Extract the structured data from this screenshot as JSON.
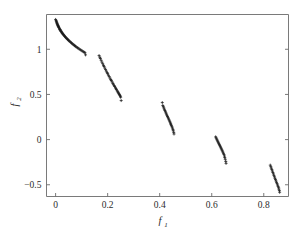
{
  "figure": {
    "background_color": "#ffffff",
    "axis_color": "#6b6b6b",
    "marker_color": "#1a1a1a",
    "marker_symbol": "plus-marker"
  },
  "axes": {
    "x_title": "f",
    "x_subscript": "1",
    "y_title": "f",
    "y_subscript": "2",
    "x_ticks": [
      "0",
      "0.2",
      "0.4",
      "0.6",
      "0.8"
    ],
    "x_tick_values": [
      0,
      0.2,
      0.4,
      0.6,
      0.8
    ],
    "y_ticks": [
      "1",
      "0.5",
      "0",
      "−0.5"
    ],
    "y_tick_values": [
      1,
      0.5,
      0,
      -0.5
    ]
  },
  "chart_data": {
    "type": "scatter",
    "title": "",
    "subtitle": "",
    "xlabel": "f1",
    "ylabel": "f2",
    "xlim": [
      -0.035,
      0.895
    ],
    "ylim": [
      -0.63,
      1.385
    ],
    "grid": false,
    "legend": null,
    "marker": "plus",
    "marker_size": 3.0,
    "marker_color": "#1a1a1a",
    "series": [
      {
        "name": "pareto-front-segment-1",
        "x": [
          0.0,
          0.002,
          0.003,
          0.004,
          0.005,
          0.006,
          0.007,
          0.008,
          0.009,
          0.01,
          0.011,
          0.012,
          0.013,
          0.015,
          0.016,
          0.017,
          0.018,
          0.02,
          0.021,
          0.023,
          0.025,
          0.026,
          0.028,
          0.03,
          0.032,
          0.034,
          0.036,
          0.038,
          0.04,
          0.043,
          0.045,
          0.047,
          0.05,
          0.052,
          0.055,
          0.058,
          0.061,
          0.064,
          0.067,
          0.07,
          0.073,
          0.076,
          0.079,
          0.083,
          0.086,
          0.09,
          0.094,
          0.098,
          0.102,
          0.106,
          0.11,
          0.113,
          0.115
        ],
        "y": [
          1.33,
          1.318,
          1.308,
          1.299,
          1.291,
          1.283,
          1.276,
          1.269,
          1.262,
          1.256,
          1.25,
          1.244,
          1.238,
          1.227,
          1.222,
          1.217,
          1.212,
          1.203,
          1.198,
          1.19,
          1.181,
          1.177,
          1.169,
          1.162,
          1.155,
          1.148,
          1.141,
          1.134,
          1.128,
          1.119,
          1.113,
          1.107,
          1.099,
          1.093,
          1.085,
          1.077,
          1.07,
          1.062,
          1.055,
          1.048,
          1.041,
          1.034,
          1.027,
          1.019,
          1.013,
          1.005,
          0.997,
          0.989,
          0.982,
          0.974,
          0.967,
          0.961,
          0.938
        ]
      },
      {
        "name": "pareto-front-segment-2",
        "x": [
          0.167,
          0.17,
          0.172,
          0.175,
          0.178,
          0.181,
          0.184,
          0.186,
          0.189,
          0.192,
          0.195,
          0.198,
          0.2,
          0.203,
          0.206,
          0.209,
          0.212,
          0.214,
          0.217,
          0.22,
          0.222,
          0.225,
          0.227,
          0.23,
          0.232,
          0.234,
          0.237,
          0.239,
          0.241,
          0.243,
          0.245,
          0.247,
          0.249,
          0.25,
          0.252
        ],
        "y": [
          0.93,
          0.912,
          0.898,
          0.878,
          0.858,
          0.84,
          0.822,
          0.81,
          0.792,
          0.775,
          0.758,
          0.741,
          0.73,
          0.713,
          0.697,
          0.681,
          0.665,
          0.654,
          0.639,
          0.623,
          0.613,
          0.598,
          0.588,
          0.573,
          0.563,
          0.553,
          0.539,
          0.529,
          0.519,
          0.509,
          0.499,
          0.489,
          0.479,
          0.469,
          0.432
        ]
      },
      {
        "name": "pareto-front-segment-3",
        "x": [
          0.41,
          0.412,
          0.414,
          0.416,
          0.418,
          0.42,
          0.422,
          0.424,
          0.426,
          0.428,
          0.43,
          0.432,
          0.434,
          0.436,
          0.438,
          0.44,
          0.442,
          0.443,
          0.445,
          0.447,
          0.449,
          0.451,
          0.452,
          0.454,
          0.455
        ],
        "y": [
          0.41,
          0.378,
          0.364,
          0.35,
          0.336,
          0.322,
          0.308,
          0.295,
          0.282,
          0.269,
          0.256,
          0.243,
          0.23,
          0.218,
          0.205,
          0.193,
          0.18,
          0.168,
          0.155,
          0.142,
          0.128,
          0.113,
          0.098,
          0.08,
          0.062
        ]
      },
      {
        "name": "pareto-front-segment-4",
        "x": [
          0.615,
          0.617,
          0.619,
          0.621,
          0.623,
          0.625,
          0.627,
          0.629,
          0.631,
          0.633,
          0.635,
          0.637,
          0.639,
          0.641,
          0.643,
          0.645,
          0.647,
          0.649,
          0.65,
          0.652,
          0.654,
          0.655
        ],
        "y": [
          0.03,
          0.018,
          0.006,
          -0.006,
          -0.018,
          -0.03,
          -0.042,
          -0.054,
          -0.066,
          -0.078,
          -0.09,
          -0.102,
          -0.114,
          -0.126,
          -0.139,
          -0.152,
          -0.166,
          -0.182,
          -0.199,
          -0.218,
          -0.242,
          -0.263
        ]
      },
      {
        "name": "pareto-front-segment-5",
        "x": [
          0.825,
          0.827,
          0.829,
          0.831,
          0.833,
          0.835,
          0.837,
          0.839,
          0.841,
          0.843,
          0.845,
          0.847,
          0.849,
          0.851,
          0.853,
          0.855,
          0.857,
          0.858,
          0.86,
          0.861
        ],
        "y": [
          -0.283,
          -0.3,
          -0.316,
          -0.332,
          -0.348,
          -0.364,
          -0.38,
          -0.396,
          -0.412,
          -0.428,
          -0.443,
          -0.458,
          -0.473,
          -0.488,
          -0.503,
          -0.518,
          -0.533,
          -0.548,
          -0.565,
          -0.583
        ]
      }
    ]
  }
}
